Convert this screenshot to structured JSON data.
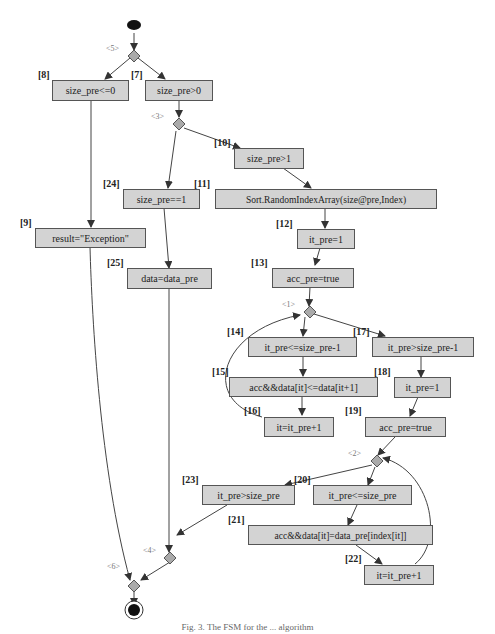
{
  "diagram": {
    "type": "state-machine / activity flow",
    "initial_node": "start",
    "final_node": "end",
    "decision_nodes": [
      {
        "id": "5",
        "label": "<5>"
      },
      {
        "id": "3",
        "label": "<3>"
      },
      {
        "id": "1",
        "label": "<1>"
      },
      {
        "id": "2",
        "label": "<2>"
      },
      {
        "id": "4",
        "label": "<4>"
      },
      {
        "id": "6",
        "label": "<6>"
      }
    ],
    "nodes": [
      {
        "id": "8",
        "tag": "[8]",
        "text": "size_pre<=0"
      },
      {
        "id": "7",
        "tag": "[7]",
        "text": "size_pre>0"
      },
      {
        "id": "10",
        "tag": "[10]",
        "text": "size_pre>1"
      },
      {
        "id": "11",
        "tag": "[11]",
        "text": "Sort.RandomIndexArray(size@pre,Index)"
      },
      {
        "id": "24",
        "tag": "[24]",
        "text": "size_pre==1"
      },
      {
        "id": "9",
        "tag": "[9]",
        "text": "result=\"Exception\""
      },
      {
        "id": "12",
        "tag": "[12]",
        "text": "it_pre=1"
      },
      {
        "id": "25",
        "tag": "[25]",
        "text": "data=data_pre"
      },
      {
        "id": "13",
        "tag": "[13]",
        "text": "acc_pre=true"
      },
      {
        "id": "14",
        "tag": "[14]",
        "text": "it_pre<=size_pre-1"
      },
      {
        "id": "17",
        "tag": "[17]",
        "text": "it_pre>size_pre-1"
      },
      {
        "id": "15",
        "tag": "[15]",
        "text": "acc&&data[it]<=data[it+1]"
      },
      {
        "id": "18",
        "tag": "[18]",
        "text": "it_pre=1"
      },
      {
        "id": "16",
        "tag": "[16]",
        "text": "it=it_pre+1"
      },
      {
        "id": "19",
        "tag": "[19]",
        "text": "acc_pre=true"
      },
      {
        "id": "23",
        "tag": "[23]",
        "text": "it_pre>size_pre"
      },
      {
        "id": "20",
        "tag": "[20]",
        "text": "it_pre<=size_pre"
      },
      {
        "id": "21",
        "tag": "[21]",
        "text": "acc&&data[it]=data_pre[index[it]]"
      },
      {
        "id": "22",
        "tag": "[22]",
        "text": "it=it_pre+1"
      }
    ],
    "edges": [
      [
        "start",
        "<5>"
      ],
      [
        "<5>",
        "8"
      ],
      [
        "<5>",
        "7"
      ],
      [
        "7",
        "<3>"
      ],
      [
        "<3>",
        "10"
      ],
      [
        "<3>",
        "24"
      ],
      [
        "10",
        "11"
      ],
      [
        "11",
        "12"
      ],
      [
        "12",
        "13"
      ],
      [
        "13",
        "<1>"
      ],
      [
        "<1>",
        "14"
      ],
      [
        "<1>",
        "17"
      ],
      [
        "14",
        "15"
      ],
      [
        "15",
        "16"
      ],
      [
        "16",
        "<1>"
      ],
      [
        "17",
        "18"
      ],
      [
        "18",
        "19"
      ],
      [
        "19",
        "<2>"
      ],
      [
        "<2>",
        "23"
      ],
      [
        "<2>",
        "20"
      ],
      [
        "20",
        "21"
      ],
      [
        "21",
        "22"
      ],
      [
        "22",
        "<2>"
      ],
      [
        "8",
        "9"
      ],
      [
        "24",
        "25"
      ],
      [
        "25",
        "<4>"
      ],
      [
        "23",
        "<4>"
      ],
      [
        "9",
        "<6>"
      ],
      [
        "<4>",
        "<6>"
      ],
      [
        "<6>",
        "end"
      ]
    ]
  },
  "caption": "Fig. 3. The FSM for the ... algorithm"
}
